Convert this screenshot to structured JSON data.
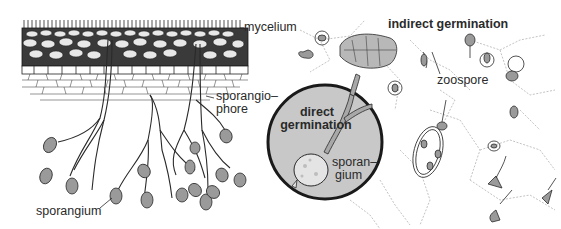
{
  "figure": {
    "colors": {
      "ink": "#2a2a2a",
      "circle_fill": "#c8c8c8",
      "circle_stroke": "#1a1a1a",
      "background": "#ffffff",
      "spore_fill": "#9a9a9a"
    }
  },
  "labels": {
    "mycelium": "mycelium",
    "sporangiophore_line1": "sporangio–",
    "sporangiophore_line2": "phore",
    "sporangium_left": "sporangium",
    "indirect_germination": "indirect germination",
    "zoospore": "zoospore",
    "direct_line1": "direct",
    "direct_line2": "germination",
    "sporangium_inset_line1": "sporan–",
    "sporangium_inset_line2": "gium"
  },
  "regions": [
    {
      "name": "leaf-cross-section",
      "description": "epidermis, palisade and spongy mesophyll with mycelium"
    },
    {
      "name": "sporangiophores",
      "description": "branching stalks emerging below leaf bearing sporangia"
    },
    {
      "name": "direct-germination-inset",
      "description": "gray circular inset with germinating sporangium"
    },
    {
      "name": "indirect-germination-field",
      "description": "zoospores on leaf surface cells"
    }
  ]
}
